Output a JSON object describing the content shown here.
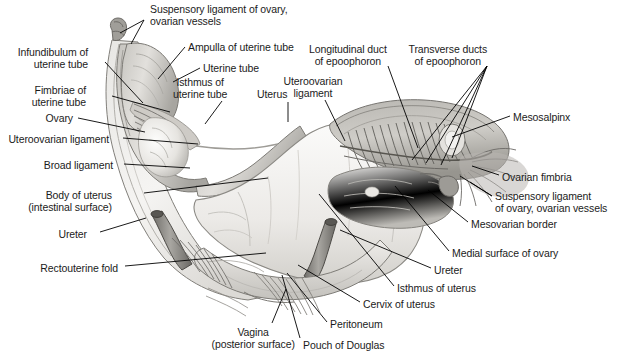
{
  "figure": {
    "type": "anatomical-illustration",
    "background_color": "#ffffff",
    "label_text_color": "#1b1b1b",
    "leader_line_color": "#000000",
    "anatomy_fill_light": "#f2f1ef",
    "anatomy_fill_mid": "#cfcdc9",
    "anatomy_fill_dark": "#9b9a96",
    "anatomy_outline": "#6d6c68"
  },
  "labels": [
    {
      "id": "suspensory-ligament-of-ovary-top",
      "lines": [
        "Suspensory ligament of ovary,",
        "ovarian vessels"
      ],
      "align": "left",
      "x": 150,
      "y": 4
    },
    {
      "id": "infundibulum-of-uterine-tube",
      "lines": [
        "Infundibulum of",
        "uterine tube"
      ],
      "align": "right",
      "x": 18,
      "y": 47
    },
    {
      "id": "ampulla-of-uterine-tube",
      "lines": [
        "Ampulla of uterine tube"
      ],
      "align": "left",
      "x": 188,
      "y": 42
    },
    {
      "id": "uterine-tube",
      "lines": [
        "Uterine tube"
      ],
      "align": "left",
      "x": 203,
      "y": 63
    },
    {
      "id": "isthmus-of-uterine-tube",
      "lines": [
        "Isthmus of",
        "uterine tube"
      ],
      "align": "center",
      "x": 200,
      "y": 77
    },
    {
      "id": "fimbriae-of-uterine-tube",
      "lines": [
        "Fimbriae of",
        "uterine tube"
      ],
      "align": "right",
      "x": 32,
      "y": 85
    },
    {
      "id": "uterus",
      "lines": [
        "Uterus"
      ],
      "align": "center",
      "x": 272,
      "y": 89
    },
    {
      "id": "uteroovarian-ligament-right",
      "lines": [
        "Uteroovarian",
        "ligament"
      ],
      "align": "center",
      "x": 313,
      "y": 76
    },
    {
      "id": "longitudinal-duct-of-epoophoron",
      "lines": [
        "Longitudinal duct",
        "of epoophoron"
      ],
      "align": "center",
      "x": 348,
      "y": 44
    },
    {
      "id": "transverse-ducts-of-epoophoron",
      "lines": [
        "Transverse ducts",
        "of epoophoron"
      ],
      "align": "center",
      "x": 448,
      "y": 44
    },
    {
      "id": "mesosalpinx",
      "lines": [
        "Mesosalpinx"
      ],
      "align": "left",
      "x": 513,
      "y": 112
    },
    {
      "id": "ovary",
      "lines": [
        "Ovary"
      ],
      "align": "right",
      "x": 45,
      "y": 113
    },
    {
      "id": "uteroovarian-ligament-left",
      "lines": [
        "Uteroovarian ligament"
      ],
      "align": "right",
      "x": 8,
      "y": 134
    },
    {
      "id": "broad-ligament",
      "lines": [
        "Broad ligament"
      ],
      "align": "right",
      "x": 44,
      "y": 160
    },
    {
      "id": "ovarian-fimbria",
      "lines": [
        "Ovarian fimbria"
      ],
      "align": "left",
      "x": 502,
      "y": 172
    },
    {
      "id": "suspensory-ligament-of-ovary-right",
      "lines": [
        "Suspensory ligament",
        "of ovary, ovarian vessels"
      ],
      "align": "left",
      "x": 495,
      "y": 191
    },
    {
      "id": "body-of-uterus",
      "lines": [
        "Body of uterus",
        "(intestinal surface)"
      ],
      "align": "right",
      "x": 28,
      "y": 190
    },
    {
      "id": "mesovarian-border",
      "lines": [
        "Mesovarian border"
      ],
      "align": "left",
      "x": 471,
      "y": 219
    },
    {
      "id": "ureter-left",
      "lines": [
        "Ureter"
      ],
      "align": "right",
      "x": 58,
      "y": 229
    },
    {
      "id": "medial-surface-of-ovary",
      "lines": [
        "Medial surface of ovary"
      ],
      "align": "left",
      "x": 452,
      "y": 248
    },
    {
      "id": "ureter-right",
      "lines": [
        "Ureter"
      ],
      "align": "left",
      "x": 434,
      "y": 265
    },
    {
      "id": "rectouterine-fold",
      "lines": [
        "Rectouterine fold"
      ],
      "align": "right",
      "x": 40,
      "y": 263
    },
    {
      "id": "isthmus-of-uterus",
      "lines": [
        "Isthmus of uterus"
      ],
      "align": "left",
      "x": 397,
      "y": 283
    },
    {
      "id": "cervix-of-uterus",
      "lines": [
        "Cervix of uterus"
      ],
      "align": "left",
      "x": 363,
      "y": 299
    },
    {
      "id": "peritoneum",
      "lines": [
        "Peritoneum"
      ],
      "align": "left",
      "x": 330,
      "y": 319
    },
    {
      "id": "vagina",
      "lines": [
        "Vagina",
        "(posterior surface)"
      ],
      "align": "center",
      "x": 253,
      "y": 327
    },
    {
      "id": "pouch-of-douglas",
      "lines": [
        "Pouch of Douglas"
      ],
      "align": "left",
      "x": 303,
      "y": 340
    }
  ],
  "leader_lines": [
    {
      "id": "leader-suspensory-top-a",
      "points": "144,20 120,33"
    },
    {
      "id": "leader-suspensory-top-b",
      "points": "144,20 131,44"
    },
    {
      "id": "leader-infundibulum",
      "points": "105,62 143,103"
    },
    {
      "id": "leader-ampulla",
      "points": "185,47 158,79"
    },
    {
      "id": "leader-uterine-tube",
      "points": "200,68 173,82"
    },
    {
      "id": "leader-isthmus-tube",
      "points": "222,101 205,124"
    },
    {
      "id": "leader-fimbriae",
      "points": "112,96 170,112"
    },
    {
      "id": "leader-uterus",
      "points": "288,102 288,122"
    },
    {
      "id": "leader-uteroovarian-right",
      "points": "325,100 345,141"
    },
    {
      "id": "leader-longitudinal-duct",
      "points": "388,66 418,148"
    },
    {
      "id": "leader-transverse-a",
      "points": "487,66 412,160"
    },
    {
      "id": "leader-transverse-b",
      "points": "487,66 426,163"
    },
    {
      "id": "leader-transverse-c",
      "points": "487,66 441,165"
    },
    {
      "id": "leader-transverse-d",
      "points": "487,66 452,158"
    },
    {
      "id": "leader-mesosalpinx",
      "points": "510,116 452,137"
    },
    {
      "id": "leader-ovary",
      "points": "78,118 145,132"
    },
    {
      "id": "leader-uteroovarian-left",
      "points": "123,138 198,144"
    },
    {
      "id": "leader-broad-ligament",
      "points": "124,164 190,168"
    },
    {
      "id": "leader-ovarian-fimbria",
      "points": "499,175 472,166"
    },
    {
      "id": "leader-suspensory-right-a",
      "points": "492,196 460,176"
    },
    {
      "id": "leader-suspensory-right-b",
      "points": "492,196 470,182"
    },
    {
      "id": "leader-body-uterus",
      "points": "144,193 268,178"
    },
    {
      "id": "leader-mesovarian",
      "points": "468,222 428,190"
    },
    {
      "id": "leader-ureter-left",
      "points": "100,232 146,218"
    },
    {
      "id": "leader-medial-ovary",
      "points": "449,251 395,186"
    },
    {
      "id": "leader-ureter-right",
      "points": "431,268 340,230"
    },
    {
      "id": "leader-rectouterine",
      "points": "125,266 266,253"
    },
    {
      "id": "leader-isthmus-uterus",
      "points": "394,286 319,194"
    },
    {
      "id": "leader-cervix",
      "points": "360,302 298,265"
    },
    {
      "id": "leader-peritoneum",
      "points": "327,322 287,273"
    },
    {
      "id": "leader-vagina",
      "points": "272,323 286,289"
    },
    {
      "id": "leader-pouch-douglas",
      "points": "300,338 282,275"
    }
  ]
}
